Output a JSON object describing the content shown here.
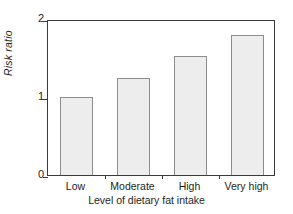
{
  "chart_data": {
    "type": "bar",
    "title": "",
    "subtitle": "",
    "categories": [
      "Low",
      "Moderate",
      "High",
      "Very high"
    ],
    "values": [
      1.0,
      1.25,
      1.53,
      1.8
    ],
    "xlabel": "Level of dietary fat intake",
    "ylabel": "Risk ratio",
    "ylim": [
      0,
      2
    ],
    "yticks": [
      0,
      1,
      2
    ],
    "ytick_labels": [
      "0",
      "1",
      "2"
    ],
    "grid": false,
    "legend": null,
    "annotations": [],
    "bar_fill_color": "#ededed",
    "bar_edge_color": "#8d8d8d",
    "axis_color": "#3a3a3a",
    "background_color": "#ffffff"
  },
  "axes": {
    "y_title": "Risk ratio",
    "x_title": "Level of dietary fat intake",
    "y_tick_0": "0",
    "y_tick_1": "1",
    "y_tick_2": "2"
  },
  "categories": {
    "c0": "Low",
    "c1": "Moderate",
    "c2": "High",
    "c3": "Very high"
  }
}
